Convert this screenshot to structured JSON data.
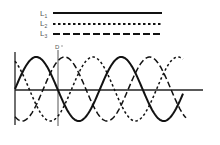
{
  "legend": {
    "items": [
      {
        "label": "L",
        "sub": "1",
        "style": "solid"
      },
      {
        "label": "L",
        "sub": "2",
        "style": "dotted"
      },
      {
        "label": "L",
        "sub": "3",
        "style": "dashed"
      }
    ]
  },
  "marker": {
    "label": "D"
  },
  "colors": {
    "line": "#111111",
    "text": "#555555"
  }
}
